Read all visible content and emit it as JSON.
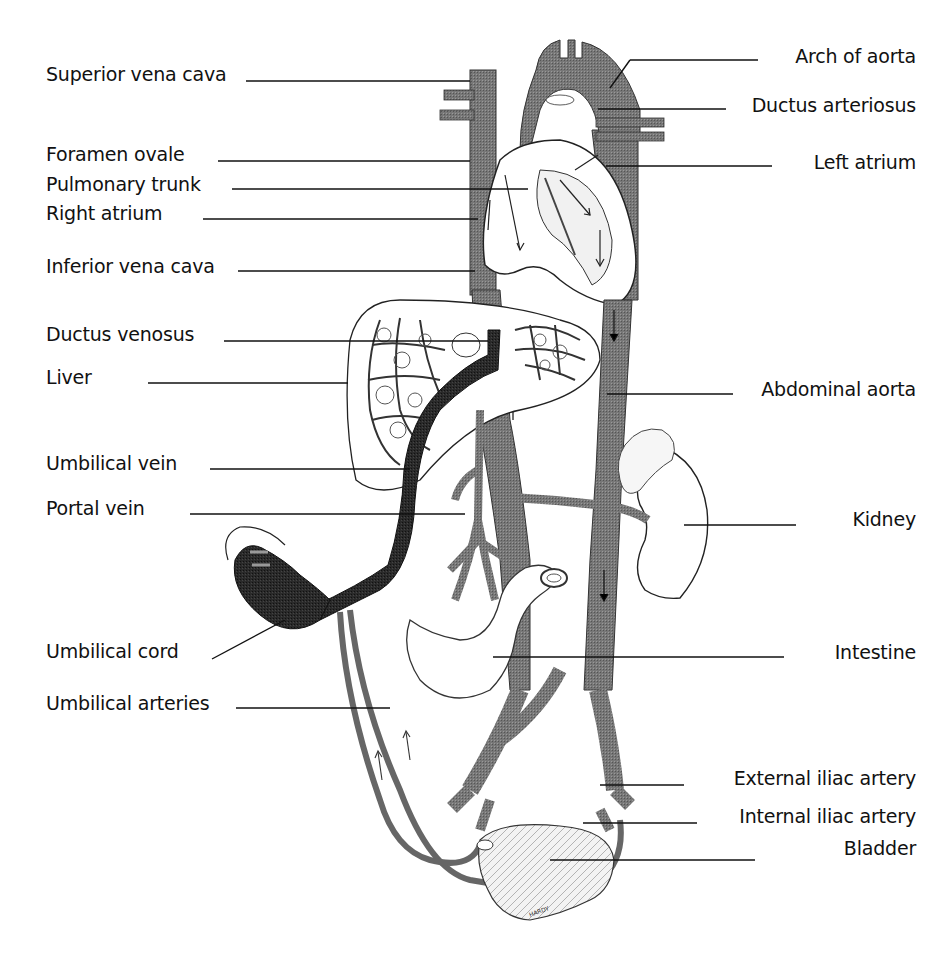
{
  "diagram": {
    "colors": {
      "background": "#ffffff",
      "ink": "#111111",
      "vessel_gray": "#6e6e6e",
      "vessel_dark": "#2a2a2a",
      "vessel_mid": "#8a8a8a",
      "organ_fill": "#ffffff"
    },
    "labels_left": [
      {
        "id": "superior-vena-cava",
        "text": "Superior vena cava",
        "x": 46,
        "y": 63,
        "line_from": [
          246,
          81
        ],
        "line_to": [
          470,
          81
        ]
      },
      {
        "id": "foramen-ovale",
        "text": "Foramen ovale",
        "x": 46,
        "y": 143,
        "line_from": [
          218,
          161
        ],
        "line_to": [
          470,
          161
        ]
      },
      {
        "id": "pulmonary-trunk",
        "text": "Pulmonary trunk",
        "x": 46,
        "y": 173,
        "line_from": [
          232,
          189
        ],
        "line_to": [
          528,
          189
        ]
      },
      {
        "id": "right-atrium",
        "text": "Right atrium",
        "x": 46,
        "y": 202,
        "line_from": [
          203,
          219
        ],
        "line_to": [
          478,
          219
        ]
      },
      {
        "id": "inferior-vena-cava",
        "text": "Inferior vena cava",
        "x": 46,
        "y": 255,
        "line_from": [
          238,
          271
        ],
        "line_to": [
          475,
          271
        ]
      },
      {
        "id": "ductus-venosus",
        "text": "Ductus venosus",
        "x": 46,
        "y": 323,
        "line_from": [
          224,
          341
        ],
        "line_to": [
          488,
          341
        ]
      },
      {
        "id": "liver",
        "text": "Liver",
        "x": 46,
        "y": 366,
        "line_from": [
          148,
          383
        ],
        "line_to": [
          348,
          383
        ]
      },
      {
        "id": "umbilical-vein",
        "text": "Umbilical vein",
        "x": 46,
        "y": 452,
        "line_from": [
          210,
          469
        ],
        "line_to": [
          410,
          469
        ]
      },
      {
        "id": "portal-vein",
        "text": "Portal vein",
        "x": 46,
        "y": 497,
        "line_from": [
          190,
          514
        ],
        "line_to": [
          465,
          514
        ]
      },
      {
        "id": "umbilical-cord",
        "text": "Umbilical cord",
        "x": 46,
        "y": 640,
        "line_from": [
          212,
          659
        ],
        "line_to": [
          285,
          620
        ]
      },
      {
        "id": "umbilical-arteries",
        "text": "Umbilical arteries",
        "x": 46,
        "y": 692,
        "line_from": [
          236,
          708
        ],
        "line_to": [
          390,
          708
        ]
      }
    ],
    "labels_right": [
      {
        "id": "arch-of-aorta",
        "text": "Arch of aorta",
        "x_right": 916,
        "y": 45,
        "line_from": [
          758,
          60
        ],
        "line_to": [
          630,
          60
        ]
      },
      {
        "id": "ductus-arteriosus",
        "text": "Ductus arteriosus",
        "x_right": 916,
        "y": 94,
        "line_from": [
          726,
          109
        ],
        "line_to": [
          598,
          109
        ]
      },
      {
        "id": "left-atrium",
        "text": "Left atrium",
        "x_right": 916,
        "y": 151,
        "line_from": [
          772,
          166
        ],
        "line_to": [
          606,
          166
        ]
      },
      {
        "id": "abdominal-aorta",
        "text": "Abdominal aorta",
        "x_right": 916,
        "y": 378,
        "line_from": [
          733,
          394
        ],
        "line_to": [
          607,
          394
        ]
      },
      {
        "id": "kidney",
        "text": "Kidney",
        "x_right": 916,
        "y": 508,
        "line_from": [
          796,
          525
        ],
        "line_to": [
          684,
          525
        ]
      },
      {
        "id": "intestine",
        "text": "Intestine",
        "x_right": 916,
        "y": 641,
        "line_from": [
          784,
          657
        ],
        "line_to": [
          493,
          657
        ]
      },
      {
        "id": "external-iliac-artery",
        "text": "External iliac artery",
        "x_right": 916,
        "y": 767,
        "line_from": [
          684,
          785
        ],
        "line_to": [
          600,
          785
        ]
      },
      {
        "id": "internal-iliac-artery",
        "text": "Internal iliac artery",
        "x_right": 916,
        "y": 805,
        "line_from": [
          697,
          823
        ],
        "line_to": [
          583,
          823
        ]
      },
      {
        "id": "bladder",
        "text": "Bladder",
        "x_right": 916,
        "y": 837,
        "line_from": [
          755,
          860
        ],
        "line_to": [
          550,
          860
        ]
      }
    ],
    "signature": "HARDY"
  }
}
